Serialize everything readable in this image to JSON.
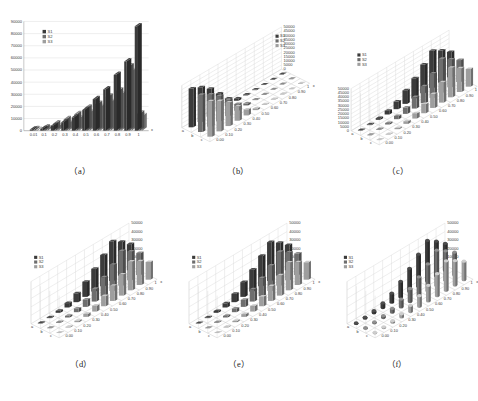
{
  "figure": {
    "panel_count": 6,
    "background": "#ffffff",
    "series_colors": [
      "#3b3b3b",
      "#6e6e6e",
      "#9e9e9e"
    ],
    "panels": [
      {
        "id": "a",
        "caption": "（a）"
      },
      {
        "id": "b",
        "caption": "（b）"
      },
      {
        "id": "c",
        "caption": "（c）"
      },
      {
        "id": "d",
        "caption": "（d）"
      },
      {
        "id": "e",
        "caption": "（e）"
      },
      {
        "id": "f",
        "caption": "（f）"
      }
    ]
  },
  "chart_data": [
    {
      "type": "bar",
      "panel": "a",
      "title": "",
      "xlabel": "x",
      "ylabel": "",
      "projection": "3d-shallow",
      "bar_shape": "rectangular",
      "grid": true,
      "legend_position": "top-left",
      "legend": [
        "S1",
        "S2",
        "S3"
      ],
      "categories": [
        "0.01",
        "0.1",
        "0.2",
        "0.3",
        "0.4",
        "0.5",
        "0.6",
        "0.7",
        "0.8",
        "0.9",
        "1"
      ],
      "ylim": [
        0,
        90000
      ],
      "yticks": [
        0,
        10000,
        20000,
        30000,
        40000,
        50000,
        60000,
        70000,
        80000,
        90000
      ],
      "ytick_labels": [
        "0",
        "10000",
        "20000",
        "30000",
        "40000",
        "50000",
        "60000",
        "70000",
        "80000",
        "90000"
      ],
      "series": [
        {
          "name": "S1",
          "values": [
            900,
            1500,
            4000,
            7000,
            11000,
            17000,
            26000,
            34000,
            46000,
            57000,
            86000
          ]
        },
        {
          "name": "S2",
          "values": [
            1200,
            2600,
            6000,
            9500,
            13500,
            19000,
            22000,
            28000,
            33000,
            53000,
            14000
          ]
        },
        {
          "name": "S3",
          "values": [
            700,
            1800,
            3400,
            6200,
            10000,
            15000,
            19500,
            23500,
            30000,
            49000,
            12000
          ]
        }
      ]
    },
    {
      "type": "bar",
      "panel": "b",
      "title": "",
      "xlabel": "x",
      "ylabel": "",
      "projection": "3d",
      "bar_shape": "rectangular",
      "grid": true,
      "legend_position": "top-right",
      "legend": [
        "S1",
        "S2",
        "S3"
      ],
      "categories": [
        "0.00",
        "0.10",
        "0.20",
        "0.30",
        "0.40",
        "0.50",
        "0.60",
        "0.70",
        "0.80",
        "0.90",
        "1"
      ],
      "rows": [
        "a",
        "b",
        "c"
      ],
      "ylim": [
        0,
        50000
      ],
      "yticks": [
        0,
        5000,
        10000,
        15000,
        20000,
        25000,
        30000,
        35000,
        40000,
        45000,
        50000
      ],
      "ytick_labels": [
        "0",
        "5000",
        "10000",
        "15000",
        "20000",
        "25000",
        "30000",
        "35000",
        "40000",
        "45000",
        "50000"
      ],
      "series": [
        {
          "name": "S1",
          "values": [
            46000,
            41000,
            33000,
            21000,
            9000,
            2500,
            900,
            600,
            400,
            300,
            200
          ]
        },
        {
          "name": "S2",
          "values": [
            44000,
            38000,
            30000,
            19000,
            8000,
            2200,
            800,
            500,
            350,
            260,
            180
          ]
        },
        {
          "name": "S3",
          "values": [
            42000,
            36000,
            28000,
            17000,
            7000,
            2000,
            700,
            450,
            300,
            220,
            160
          ]
        }
      ]
    },
    {
      "type": "bar",
      "panel": "c",
      "title": "",
      "xlabel": "x",
      "ylabel": "",
      "projection": "3d",
      "bar_shape": "rectangular",
      "grid": true,
      "legend_position": "left",
      "legend": [
        "S1",
        "S2",
        "S3"
      ],
      "categories": [
        "0.00",
        "0.10",
        "0.20",
        "0.30",
        "0.40",
        "0.50",
        "0.60",
        "0.70",
        "0.80",
        "0.90",
        "1"
      ],
      "rows": [
        "a",
        "b",
        "c"
      ],
      "ylim": [
        0,
        50000
      ],
      "yticks": [
        0,
        5000,
        10000,
        15000,
        20000,
        25000,
        30000,
        35000,
        40000,
        45000,
        50000
      ],
      "ytick_labels": [
        "0",
        "5000",
        "10000",
        "15000",
        "20000",
        "25000",
        "30000",
        "35000",
        "40000",
        "45000",
        "50000"
      ],
      "series": [
        {
          "name": "S1",
          "values": [
            500,
            900,
            2000,
            4500,
            9000,
            16000,
            24000,
            34000,
            44000,
            38000,
            30000
          ]
        },
        {
          "name": "S2",
          "values": [
            400,
            800,
            1700,
            3800,
            7500,
            13500,
            20000,
            29000,
            40000,
            33000,
            26000
          ]
        },
        {
          "name": "S3",
          "values": [
            300,
            600,
            1400,
            3100,
            6200,
            11000,
            16500,
            24000,
            35000,
            28000,
            21000
          ]
        }
      ]
    },
    {
      "type": "bar",
      "panel": "d",
      "title": "",
      "xlabel": "x",
      "ylabel": "",
      "projection": "3d",
      "bar_shape": "rectangular",
      "grid": true,
      "legend_position": "left",
      "legend": [
        "S1",
        "S2",
        "S3"
      ],
      "categories": [
        "0.00",
        "0.10",
        "0.20",
        "0.30",
        "0.40",
        "0.50",
        "0.60",
        "0.70",
        "0.80",
        "0.90",
        "1"
      ],
      "rows": [
        "a",
        "b",
        "c"
      ],
      "ylim": [
        0,
        50000
      ],
      "yticks": [
        10000,
        20000,
        30000,
        40000,
        50000
      ],
      "ytick_labels": [
        "10000",
        "20000",
        "30000",
        "40000",
        "50000"
      ],
      "series": [
        {
          "name": "S1",
          "values": [
            600,
            1100,
            2400,
            5200,
            10500,
            18000,
            27000,
            37000,
            47000,
            40000,
            31000
          ]
        },
        {
          "name": "S2",
          "values": [
            500,
            950,
            2000,
            4400,
            8800,
            15000,
            22500,
            31000,
            41000,
            34000,
            26000
          ]
        },
        {
          "name": "S3",
          "values": [
            400,
            750,
            1600,
            3500,
            7000,
            12000,
            18000,
            25000,
            34000,
            28000,
            21000
          ]
        }
      ]
    },
    {
      "type": "bar",
      "panel": "e",
      "title": "",
      "xlabel": "x",
      "ylabel": "",
      "projection": "3d",
      "bar_shape": "rectangular",
      "grid": true,
      "legend_position": "left",
      "legend": [
        "S1",
        "S2",
        "S3"
      ],
      "categories": [
        "0.00",
        "0.10",
        "0.20",
        "0.30",
        "0.40",
        "0.50",
        "0.60",
        "0.70",
        "0.80",
        "0.90",
        "1"
      ],
      "rows": [
        "a",
        "b",
        "c"
      ],
      "ylim": [
        0,
        50000
      ],
      "yticks": [
        10000,
        20000,
        30000,
        40000,
        50000
      ],
      "ytick_labels": [
        "10000",
        "20000",
        "30000",
        "40000",
        "50000"
      ],
      "series": [
        {
          "name": "S1",
          "values": [
            550,
            1000,
            2200,
            4900,
            10000,
            17500,
            26000,
            36000,
            46000,
            39000,
            30000
          ]
        },
        {
          "name": "S2",
          "values": [
            470,
            880,
            1900,
            4200,
            8400,
            14500,
            21500,
            30000,
            40000,
            33000,
            25500
          ]
        },
        {
          "name": "S3",
          "values": [
            380,
            700,
            1500,
            3300,
            6700,
            11500,
            17500,
            24000,
            33000,
            27000,
            20500
          ]
        }
      ]
    },
    {
      "type": "bar",
      "panel": "f",
      "title": "",
      "xlabel": "x",
      "ylabel": "",
      "projection": "3d",
      "bar_shape": "cylinder",
      "grid": true,
      "legend_position": "left",
      "legend": [
        "S1",
        "S2",
        "S3"
      ],
      "categories": [
        "0.00",
        "0.10",
        "0.20",
        "0.30",
        "0.40",
        "0.50",
        "0.60",
        "0.70",
        "0.80",
        "0.90",
        "1"
      ],
      "rows": [
        "a",
        "b",
        "c"
      ],
      "ylim": [
        0,
        50000
      ],
      "yticks": [
        10000,
        20000,
        30000,
        40000,
        50000
      ],
      "ytick_labels": [
        "10000",
        "20000",
        "30000",
        "40000",
        "50000"
      ],
      "series": [
        {
          "name": "S1",
          "values": [
            620,
            1150,
            2500,
            5400,
            10800,
            18500,
            27500,
            38000,
            48000,
            41000,
            32000
          ]
        },
        {
          "name": "S2",
          "values": [
            520,
            980,
            2100,
            4600,
            9200,
            15500,
            23000,
            32000,
            42000,
            35000,
            27000
          ]
        },
        {
          "name": "S3",
          "values": [
            420,
            780,
            1700,
            3700,
            7400,
            12500,
            18500,
            26000,
            35000,
            29000,
            22000
          ]
        }
      ]
    }
  ]
}
